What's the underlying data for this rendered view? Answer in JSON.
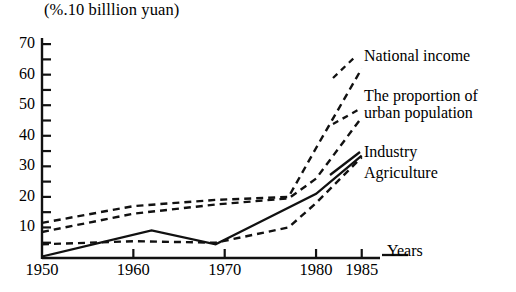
{
  "chart_data": {
    "type": "line",
    "title": "(%.10 billlion yuan)",
    "xlabel": "Years",
    "ylabel": "",
    "xlim": [
      1950,
      1987
    ],
    "ylim": [
      0,
      72
    ],
    "grid": false,
    "legend_position": "right-inline",
    "x_ticks": [
      1950,
      1960,
      1970,
      1980,
      1985
    ],
    "x_tick_labels": [
      "1950",
      "1960",
      "1970",
      "1980",
      "1985"
    ],
    "y_ticks": [
      10,
      20,
      30,
      40,
      50,
      60,
      70
    ],
    "y_tick_labels": [
      "10",
      "20",
      "30",
      "40",
      "50",
      "60",
      "70"
    ],
    "y_minor_ticks": [
      5,
      15,
      25,
      35,
      45,
      55,
      65
    ],
    "series": [
      {
        "name": "National income",
        "style": "dashed",
        "x": [
          1950,
          1960,
          1969,
          1977,
          1980,
          1985
        ],
        "values": [
          11.5,
          17.0,
          19.0,
          20.0,
          36.0,
          62.0
        ]
      },
      {
        "name": "The proportion of urban population",
        "style": "dashed",
        "x": [
          1950,
          1960,
          1969,
          1977,
          1980,
          1985
        ],
        "values": [
          8.5,
          14.5,
          17.5,
          19.5,
          26.0,
          46.0
        ]
      },
      {
        "name": "Industry",
        "style": "solid",
        "x": [
          1950,
          1962,
          1969,
          1980,
          1985
        ],
        "values": [
          0.5,
          9.0,
          4.5,
          21.0,
          33.5
        ]
      },
      {
        "name": "Agriculture",
        "style": "dashed",
        "x": [
          1950,
          1960,
          1969,
          1977,
          1980,
          1985
        ],
        "values": [
          4.5,
          5.5,
          5.0,
          10.0,
          18.0,
          33.0
        ]
      }
    ]
  },
  "axis": {
    "years_label": "Years"
  },
  "labels": {
    "national_income": "National income",
    "urban_proportion_line1": "The proportion of",
    "urban_proportion_line2": "urban population",
    "industry": "Industry",
    "agriculture": "Agriculture"
  }
}
